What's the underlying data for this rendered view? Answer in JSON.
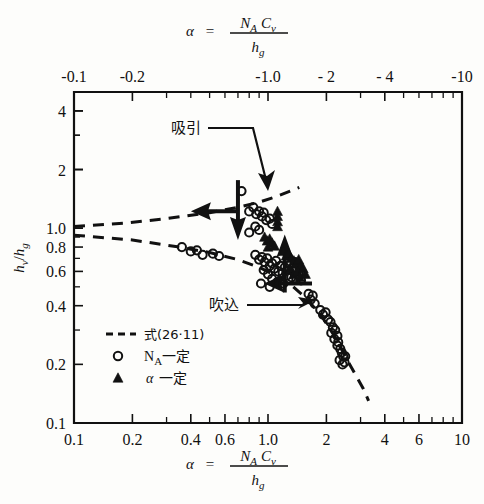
{
  "figure": {
    "top_axis_title": "α = N_A C_v / h_g",
    "bottom_axis_title": "α = N_A C_v / h_g",
    "y_axis_title": "h_v / h_g",
    "alpha_glyph": "α",
    "equals_glyph": "=",
    "numerator_na": "N",
    "numerator_a_sub": "A",
    "numerator_c": "C",
    "numerator_v_sub": "v",
    "denominator_h": "h",
    "denominator_g_sub": "g",
    "y_title_hv": "h",
    "y_title_v_sub": "v",
    "y_title_slash": "/",
    "y_title_hg": "h",
    "y_title_g_sub": "g"
  },
  "annotations": [
    {
      "name": "suction",
      "label": "吸引",
      "x": 186,
      "y": 133
    },
    {
      "name": "blowing",
      "label": "吹込",
      "x": 224,
      "y": 310
    }
  ],
  "legend": {
    "items": [
      {
        "marker": "dashed-line",
        "label": "式(26·11)"
      },
      {
        "marker": "open-circle",
        "label": "N",
        "sub": "A",
        "suffix": " 一定"
      },
      {
        "marker": "filled-triangle",
        "label": "α",
        "sub": "",
        "suffix": " 一定"
      }
    ],
    "formula_label": "式(26·11)",
    "na_const_label": "N",
    "na_const_sub": "A",
    "na_const_suffix": "一定",
    "alpha_const_label": "α",
    "alpha_const_suffix": "一定"
  },
  "chart_data": {
    "type": "scatter",
    "title": "",
    "xlabel": "α = N_A C_v / h_g",
    "ylabel": "h_v / h_g",
    "xscale": "log",
    "yscale": "log",
    "xlim": [
      0.1,
      10
    ],
    "ylim": [
      0.1,
      5
    ],
    "grid": false,
    "legend_position": "lower-left-inside",
    "x_ticks_major": [
      0.1,
      0.2,
      0.4,
      0.6,
      1.0,
      2,
      4,
      6,
      10
    ],
    "x_tick_labels": [
      "0.1",
      "0.2",
      "0.4",
      "0.6",
      "1.0",
      "2",
      "4",
      "6",
      "10"
    ],
    "y_ticks_major": [
      0.1,
      0.2,
      0.4,
      0.6,
      0.8,
      1.0,
      2,
      4
    ],
    "y_tick_labels": [
      "0.1",
      "0.2",
      "0.4",
      "0.6",
      "0.8",
      "1.0",
      "2",
      "4"
    ],
    "top_axis": {
      "reversed": true,
      "labels": [
        "-0.1",
        "-0.2",
        "-1.0",
        "- 2",
        "- 4",
        "-10"
      ],
      "values": [
        0.1,
        0.2,
        1.0,
        2,
        4,
        10
      ]
    },
    "series": [
      {
        "name": "N_A 一定",
        "marker": "open-circle",
        "points": [
          [
            0.36,
            0.8
          ],
          [
            0.4,
            0.76
          ],
          [
            0.43,
            0.77
          ],
          [
            0.46,
            0.73
          ],
          [
            0.52,
            0.74
          ],
          [
            0.56,
            0.72
          ],
          [
            0.73,
            1.55
          ],
          [
            0.8,
            1.22
          ],
          [
            0.84,
            1.28
          ],
          [
            0.87,
            1.18
          ],
          [
            0.9,
            1.22
          ],
          [
            0.93,
            1.15
          ],
          [
            0.95,
            1.2
          ],
          [
            0.98,
            1.1
          ],
          [
            1.02,
            1.12
          ],
          [
            1.05,
            1.05
          ],
          [
            0.86,
            1.02
          ],
          [
            0.9,
            0.98
          ],
          [
            0.8,
            0.95
          ],
          [
            0.86,
            0.73
          ],
          [
            0.9,
            0.69
          ],
          [
            0.93,
            0.71
          ],
          [
            0.96,
            0.67
          ],
          [
            0.99,
            0.7
          ],
          [
            1.02,
            0.64
          ],
          [
            1.05,
            0.66
          ],
          [
            1.08,
            0.62
          ],
          [
            1.1,
            0.68
          ],
          [
            1.13,
            0.6
          ],
          [
            1.16,
            0.64
          ],
          [
            1.19,
            0.59
          ],
          [
            1.22,
            0.63
          ],
          [
            1.25,
            0.57
          ],
          [
            1.28,
            0.61
          ],
          [
            1.32,
            0.56
          ],
          [
            1.36,
            0.6
          ],
          [
            1.4,
            0.55
          ],
          [
            1.44,
            0.58
          ],
          [
            1.48,
            0.54
          ],
          [
            1.0,
            0.58
          ],
          [
            1.05,
            0.55
          ],
          [
            1.12,
            0.53
          ],
          [
            1.2,
            0.52
          ],
          [
            0.95,
            0.61
          ],
          [
            1.3,
            0.65
          ],
          [
            1.38,
            0.67
          ],
          [
            1.45,
            0.63
          ],
          [
            0.92,
            0.52
          ],
          [
            1.02,
            0.5
          ],
          [
            1.62,
            0.46
          ],
          [
            1.66,
            0.43
          ],
          [
            1.7,
            0.45
          ],
          [
            1.74,
            0.41
          ],
          [
            1.86,
            0.38
          ],
          [
            1.92,
            0.36
          ],
          [
            1.98,
            0.37
          ],
          [
            2.04,
            0.34
          ],
          [
            2.1,
            0.33
          ],
          [
            2.16,
            0.31
          ],
          [
            2.22,
            0.3
          ],
          [
            2.28,
            0.28
          ],
          [
            2.12,
            0.29
          ],
          [
            2.2,
            0.27
          ],
          [
            2.28,
            0.25
          ],
          [
            2.36,
            0.24
          ],
          [
            2.3,
            0.26
          ],
          [
            2.4,
            0.23
          ],
          [
            2.44,
            0.22
          ],
          [
            2.5,
            0.22
          ],
          [
            2.34,
            0.21
          ],
          [
            2.42,
            0.2
          ],
          [
            2.48,
            0.205
          ]
        ]
      },
      {
        "name": "α 一定",
        "marker": "filled-triangle",
        "points": [
          [
            1.12,
            1.22
          ],
          [
            1.12,
            1.15
          ],
          [
            1.12,
            1.08
          ],
          [
            1.12,
            1.02
          ],
          [
            0.96,
            0.9
          ],
          [
            0.99,
            0.86
          ],
          [
            1.02,
            0.88
          ],
          [
            1.05,
            0.84
          ],
          [
            1.0,
            0.8
          ],
          [
            1.08,
            0.81
          ],
          [
            1.2,
            0.76
          ],
          [
            1.24,
            0.72
          ],
          [
            1.28,
            0.74
          ],
          [
            1.32,
            0.7
          ],
          [
            1.36,
            0.68
          ],
          [
            1.4,
            0.66
          ],
          [
            1.44,
            0.69
          ],
          [
            1.48,
            0.64
          ],
          [
            1.3,
            0.62
          ],
          [
            1.36,
            0.58
          ],
          [
            1.42,
            0.6
          ],
          [
            1.46,
            0.56
          ],
          [
            1.52,
            0.62
          ],
          [
            1.56,
            0.58
          ]
        ]
      }
    ],
    "curves": [
      {
        "name": "upper-dashed-curve",
        "style": "dashed",
        "points": [
          [
            0.1,
            1.02
          ],
          [
            0.18,
            1.06
          ],
          [
            0.3,
            1.12
          ],
          [
            0.5,
            1.2
          ],
          [
            0.7,
            1.28
          ],
          [
            0.9,
            1.36
          ],
          [
            1.1,
            1.45
          ],
          [
            1.3,
            1.55
          ],
          [
            1.45,
            1.62
          ]
        ]
      },
      {
        "name": "lower-dashed-curve",
        "style": "dashed",
        "points": [
          [
            0.1,
            0.92
          ],
          [
            0.2,
            0.87
          ],
          [
            0.35,
            0.8
          ],
          [
            0.5,
            0.75
          ],
          [
            0.7,
            0.69
          ],
          [
            0.9,
            0.63
          ],
          [
            1.1,
            0.57
          ],
          [
            1.35,
            0.5
          ],
          [
            1.6,
            0.43
          ],
          [
            1.9,
            0.35
          ],
          [
            2.2,
            0.28
          ],
          [
            2.5,
            0.22
          ],
          [
            2.8,
            0.18
          ],
          [
            3.1,
            0.15
          ],
          [
            3.3,
            0.13
          ]
        ]
      }
    ],
    "arrows": [
      {
        "name": "arrow-left-upper",
        "x": 0.42,
        "y": 1.22,
        "direction": "left"
      },
      {
        "name": "arrow-down-upper",
        "x": 0.7,
        "y": 1.1,
        "direction": "down"
      },
      {
        "name": "arrow-up-lower",
        "x": 1.22,
        "y": 0.75,
        "direction": "up"
      },
      {
        "name": "arrow-left-lower",
        "x": 1.0,
        "y": 0.52,
        "direction": "left"
      }
    ]
  }
}
